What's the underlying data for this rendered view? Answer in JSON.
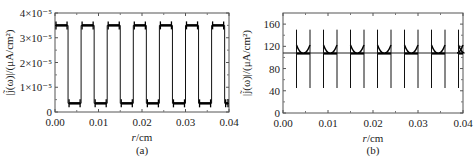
{
  "chart_data": [
    {
      "id": "a",
      "type": "line",
      "panel_label": "(a)",
      "xlabel_italic": "r",
      "xlabel_unit": "/cm",
      "ylabel": "|j̃(ω)|/(μA/cm²)",
      "xlim": [
        0.0,
        0.04
      ],
      "ylim": [
        0,
        4e-05
      ],
      "x_ticks": [
        "0.00",
        "0.01",
        "0.02",
        "0.03",
        "0.04"
      ],
      "y_ticks": [
        "0",
        "1×10⁻⁵",
        "2×10⁻⁵",
        "3×10⁻⁵",
        "4×10⁻⁵"
      ],
      "grid": false,
      "description": "Square-wave current density alternating between high and low levels across r",
      "high_level": 3.5e-05,
      "low_level": 3.5e-06,
      "period_cm": 0.006,
      "high_segments": [
        [
          0.0,
          0.003
        ],
        [
          0.006,
          0.009
        ],
        [
          0.012,
          0.015
        ],
        [
          0.018,
          0.021
        ],
        [
          0.024,
          0.027
        ],
        [
          0.03,
          0.033
        ],
        [
          0.036,
          0.039
        ]
      ],
      "low_segments": [
        [
          0.003,
          0.006
        ],
        [
          0.009,
          0.012
        ],
        [
          0.015,
          0.018
        ],
        [
          0.021,
          0.024
        ],
        [
          0.027,
          0.03
        ],
        [
          0.033,
          0.036
        ],
        [
          0.039,
          0.04
        ]
      ]
    },
    {
      "id": "b",
      "type": "line",
      "panel_label": "(b)",
      "xlabel_italic": "r",
      "xlabel_unit": "/cm",
      "ylabel": "|j̃(ω)|/(μA/cm²)",
      "xlim": [
        0.0,
        0.04
      ],
      "ylim": [
        0,
        180
      ],
      "x_ticks": [
        "0.00",
        "0.01",
        "0.02",
        "0.03",
        "0.04"
      ],
      "y_ticks": [
        "0",
        "40",
        "80",
        "120",
        "160"
      ],
      "grid": false,
      "description": "Nearly constant current density ~108 with sharp spikes (up to ~150, down to ~45) at segment edges",
      "baseline": 108,
      "spike_max": 150,
      "spike_min": 45,
      "spike_positions": [
        0.003,
        0.006,
        0.009,
        0.012,
        0.015,
        0.018,
        0.021,
        0.024,
        0.027,
        0.03,
        0.033,
        0.036,
        0.039
      ],
      "bump_segments": [
        [
          0.003,
          0.006
        ],
        [
          0.009,
          0.012
        ],
        [
          0.015,
          0.018
        ],
        [
          0.021,
          0.024
        ],
        [
          0.027,
          0.03
        ],
        [
          0.033,
          0.036
        ],
        [
          0.039,
          0.04
        ]
      ]
    }
  ]
}
